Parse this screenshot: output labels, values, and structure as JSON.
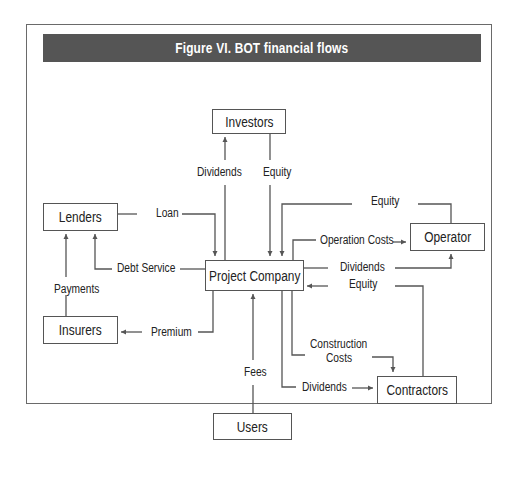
{
  "figure": {
    "title": "Figure VI. BOT financial flows"
  },
  "nodes": {
    "investors": "Investors",
    "lenders": "Lenders",
    "project_company": "Project Company",
    "operator": "Operator",
    "insurers": "Insurers",
    "contractors": "Contractors",
    "users": "Users"
  },
  "flows": {
    "investors_dividends": "Dividends",
    "investors_equity": "Equity",
    "lenders_loan": "Loan",
    "debt_service": "Debt Service",
    "payments": "Payments",
    "premium": "Premium",
    "operator_equity": "Equity",
    "operation_costs": "Operation Costs",
    "operator_dividends": "Dividends",
    "contractors_equity": "Equity",
    "construction_costs_1": "Construction",
    "construction_costs_2": "Costs",
    "contractors_dividends": "Dividends",
    "fees": "Fees"
  },
  "colors": {
    "title_bar": "#555555",
    "line": "#555555",
    "text": "#222222"
  }
}
